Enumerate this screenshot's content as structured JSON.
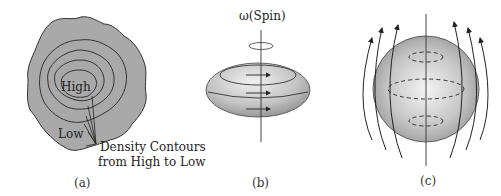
{
  "figure": {
    "panels": [
      {
        "id": "a",
        "caption": "(a)",
        "description": "Irregular cloud with nested density contours",
        "labels": {
          "center": "High",
          "edge": "Low",
          "annotation_line1": "Density Contours",
          "annotation_line2": "from High to Low"
        },
        "colors": {
          "fill": "#a9a9a9",
          "stroke": "#333333"
        }
      },
      {
        "id": "b",
        "caption": "(b)",
        "description": "Oblate spinning ellipsoid with rotation arrows",
        "labels": {
          "axis": "ω(Spin)"
        },
        "colors": {
          "fill": "#bdbdbd",
          "highlight": "#ececec",
          "stroke": "#333333"
        }
      },
      {
        "id": "c",
        "caption": "(c)",
        "description": "Sphere with magnetic field lines and dashed current loops",
        "labels": {},
        "colors": {
          "fill": "#bdbdbd",
          "highlight": "#f0f0f0",
          "stroke": "#333333"
        }
      }
    ]
  }
}
